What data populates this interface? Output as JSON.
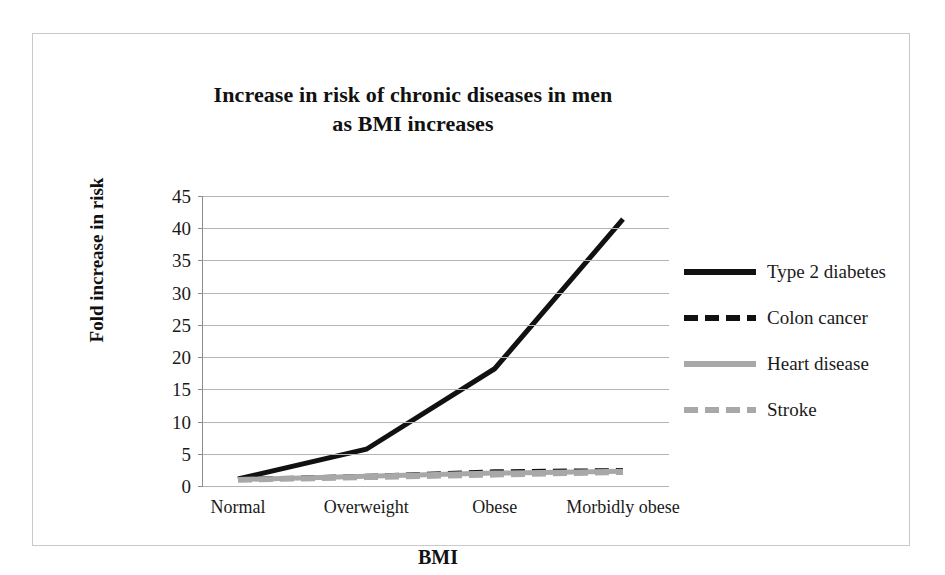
{
  "chart_data": {
    "type": "line",
    "title": "Increase in risk of chronic diseases in men as BMI increases",
    "title_line1": "Increase in risk of chronic diseases in men",
    "title_line2": "as BMI increases",
    "xlabel": "BMI",
    "ylabel": "Fold increase in risk",
    "categories": [
      "Normal",
      "Overweight",
      "Obese",
      "Morbidly obese"
    ],
    "ylim": [
      0,
      45
    ],
    "yticks": [
      0,
      5,
      10,
      15,
      20,
      25,
      30,
      35,
      40,
      45
    ],
    "ytick_labels": [
      "0",
      "5",
      "10",
      "15",
      "20",
      "25",
      "30",
      "35",
      "40",
      "45"
    ],
    "grid": true,
    "legend_position": "right",
    "series": [
      {
        "name": "Type 2 diabetes",
        "values": [
          1.1,
          5.7,
          18.2,
          41.4
        ],
        "color": "#111111",
        "style": "solid",
        "width": 5
      },
      {
        "name": "Colon cancer",
        "values": [
          1.0,
          1.5,
          2.2,
          2.4
        ],
        "color": "#111111",
        "style": "dashed",
        "width": 5
      },
      {
        "name": "Heart disease",
        "values": [
          1.0,
          1.5,
          2.0,
          2.3
        ],
        "color": "#a8a8a8",
        "style": "solid",
        "width": 5
      },
      {
        "name": "Stroke",
        "values": [
          0.9,
          1.3,
          1.7,
          2.1
        ],
        "color": "#a8a8a8",
        "style": "dashed",
        "width": 5
      }
    ]
  },
  "legend": {
    "items": [
      {
        "label": "Type 2 diabetes"
      },
      {
        "label": "Colon cancer"
      },
      {
        "label": "Heart disease"
      },
      {
        "label": "Stroke"
      }
    ]
  },
  "colors": {
    "dark_series": "#111111",
    "light_series": "#a8a8a8",
    "gridline": "#b4b4b4",
    "frame": "#c9c9c9",
    "background": "#ffffff"
  }
}
